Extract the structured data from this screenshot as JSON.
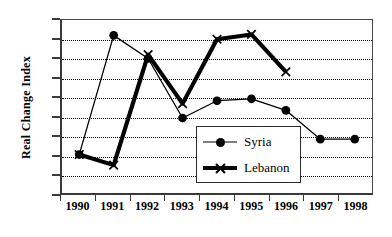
{
  "chart_data": {
    "type": "line",
    "title": "",
    "xlabel": "",
    "ylabel": "Real Change Index",
    "categories": [
      "1990",
      "1991",
      "1992",
      "1993",
      "1994",
      "1995",
      "1996",
      "1997",
      "1998"
    ],
    "ylim": [
      80,
      170
    ],
    "ytick_step": 10,
    "yticks": [
      170,
      160,
      150,
      140,
      130,
      120,
      110,
      100,
      90,
      80
    ],
    "grid": true,
    "grid_style": "dotted-horizontal",
    "legend_position": "inside-center-right",
    "series": [
      {
        "name": "Syria",
        "marker": "circle",
        "line_width": "thin",
        "color": "#000000",
        "values": [
          100,
          162,
          150,
          119,
          128,
          129,
          123,
          108,
          108
        ]
      },
      {
        "name": "Lebanon",
        "marker": "x",
        "line_width": "thick",
        "color": "#000000",
        "values": [
          100,
          94.5,
          152,
          126.5,
          160,
          162.5,
          143,
          null,
          null
        ]
      }
    ]
  },
  "legend": {
    "items": [
      {
        "label": "Syria",
        "marker": "circle-marker-icon"
      },
      {
        "label": "Lebanon",
        "marker": "x-marker-icon"
      }
    ]
  },
  "axes": {
    "y_title": "Real Change Index"
  }
}
